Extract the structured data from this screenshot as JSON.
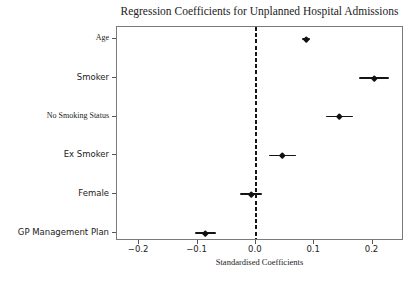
{
  "title": "Regression Coefficients for Unplanned Hospital Admissions",
  "chart_data": {
    "type": "scatter",
    "subtype": "horizontal-errorbar-coefficient-plot",
    "title": "Regression Coefficients for Unplanned Hospital Admissions",
    "xlabel": "Standardised Coefficients",
    "ylabel": "",
    "categories": [
      "Age",
      "Smoker",
      "No Smoking Status",
      "Ex Smoker",
      "Female",
      "GP Management Plan"
    ],
    "values": [
      0.086,
      0.203,
      0.143,
      0.046,
      -0.008,
      -0.086
    ],
    "ci_low": [
      0.079,
      0.177,
      0.12,
      0.023,
      -0.028,
      -0.104
    ],
    "ci_high": [
      0.093,
      0.229,
      0.166,
      0.069,
      0.01,
      -0.068
    ],
    "xlim": [
      -0.238,
      0.254
    ],
    "x_ticks": [
      -0.2,
      -0.1,
      0.0,
      0.1,
      0.2
    ],
    "x_tick_labels": [
      "−0.2",
      "−0.1",
      "0.0",
      "0.1",
      "0.2"
    ],
    "reference_line_x": 0.0,
    "reference_line_style": "dashed",
    "grid": false,
    "legend": "none",
    "marker_color": "#111111",
    "reference_line_color": "#161616",
    "serif_label_indices": [
      0,
      2
    ]
  }
}
